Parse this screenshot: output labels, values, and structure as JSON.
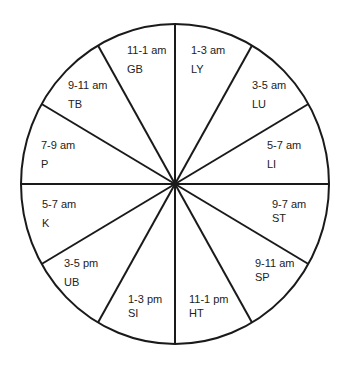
{
  "diagram": {
    "type": "organ-clock-wheel",
    "sectors": 12,
    "colors": {
      "stroke": "#1a1a1a",
      "fill": "#ffffff",
      "text": "#222222"
    },
    "segments": [
      {
        "time": "11-1 am",
        "organ": "GB",
        "x": 127,
        "y": 44,
        "gap": 6
      },
      {
        "time": "1-3 am",
        "organ": "LY",
        "x": 191,
        "y": 44,
        "gap": 6
      },
      {
        "time": "3-5 am",
        "organ": "LU",
        "x": 252,
        "y": 79,
        "gap": 6
      },
      {
        "time": "5-7 am",
        "organ": "LI",
        "x": 267,
        "y": 139,
        "gap": 6
      },
      {
        "time": "9-7 am",
        "organ": "ST",
        "x": 272,
        "y": 198,
        "gap": 1
      },
      {
        "time": "9-11 am",
        "organ": "SP",
        "x": 255,
        "y": 257,
        "gap": 1
      },
      {
        "time": "11-1 pm",
        "organ": "HT",
        "x": 189,
        "y": 293,
        "gap": 1
      },
      {
        "time": "1-3 pm",
        "organ": "SI",
        "x": 128,
        "y": 293,
        "gap": 1
      },
      {
        "time": "3-5  pm",
        "organ": "UB",
        "x": 64,
        "y": 257,
        "gap": 6
      },
      {
        "time": "5-7 am",
        "organ": "K",
        "x": 42,
        "y": 198,
        "gap": 6
      },
      {
        "time": "7-9 am",
        "organ": "P",
        "x": 41,
        "y": 139,
        "gap": 6
      },
      {
        "time": "9-11 am",
        "organ": "TB",
        "x": 68,
        "y": 79,
        "gap": 6
      }
    ]
  }
}
